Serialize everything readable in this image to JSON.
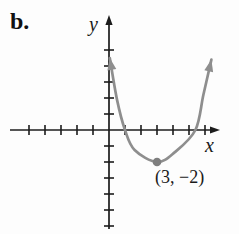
{
  "figure_label": "b.",
  "axes": {
    "x_label": "x",
    "y_label": "y"
  },
  "annotation": {
    "vertex_label": "(3, −2)"
  },
  "colors": {
    "axis": "#1c1c1c",
    "curve": "#8e8e8e",
    "vertex_dot": "#7e7e7e",
    "background": "#fdfdfd"
  },
  "chart_data": {
    "type": "line",
    "title": "",
    "xlabel": "x",
    "ylabel": "y",
    "grid": false,
    "legend": false,
    "tick_step": 1,
    "x_tick_range": [
      -5,
      6
    ],
    "y_tick_range": [
      -6,
      5
    ],
    "xlim": [
      -6.2,
      7
    ],
    "ylim": [
      -6.5,
      7.2
    ],
    "series": [
      {
        "name": "parabola",
        "shape": "upward-opening parabola",
        "vertex": [
          3,
          -2
        ],
        "x_intercepts_approx": [
          1,
          5.4
        ],
        "points": [
          [
            0.05,
            4.5
          ],
          [
            0.5,
            1.9
          ],
          [
            1,
            0
          ],
          [
            1.6,
            -1.25
          ],
          [
            3,
            -2
          ],
          [
            4.1,
            -1.4
          ],
          [
            5.4,
            0
          ],
          [
            5.9,
            2.2
          ],
          [
            6.4,
            4.4
          ]
        ]
      }
    ],
    "marked_point": {
      "x": 3,
      "y": -2,
      "label": "(3, −2)"
    }
  }
}
